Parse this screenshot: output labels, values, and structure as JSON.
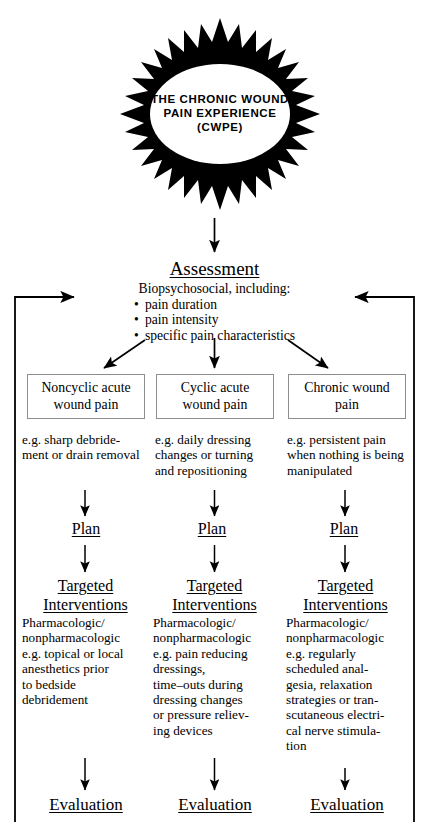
{
  "figure": {
    "background_color": "#ffffff",
    "line_color": "#000000",
    "box_border_color": "#8d8d8d"
  },
  "starburst": {
    "icon": "starburst-shape",
    "line1": "THE CHRONIC WOUND",
    "line2": "PAIN EXPERIENCE",
    "line3": "(CWPE)"
  },
  "assessment": {
    "heading": "Assessment",
    "subheading": "Biopsychosocial, including:",
    "bullets": [
      "pain duration",
      "pain intensity",
      "specific pain characteristics"
    ]
  },
  "columns": [
    {
      "category": "Noncyclic acute\nwound pain",
      "example": "e.g. sharp debride-\nment or drain removal",
      "plan": "Plan",
      "interventions_heading_line1": "Targeted",
      "interventions_heading_line2": "Interventions",
      "intervention_detail": "Pharmacologic/\nnonpharmacologic\ne.g. topical or local\nanesthetics prior\nto bedside\ndebridement",
      "evaluation": "Evaluation"
    },
    {
      "category": "Cyclic acute\nwound pain",
      "example": "e.g. daily dressing\nchanges or turning\nand repositioning",
      "plan": "Plan",
      "interventions_heading_line1": "Targeted",
      "interventions_heading_line2": "Interventions",
      "intervention_detail": "Pharmacologic/\nnonpharmacologic\ne.g. pain reducing\ndressings,\ntime–outs during\ndressing changes\nor pressure reliev-\ning devices",
      "evaluation": "Evaluation"
    },
    {
      "category": "Chronic wound\npain",
      "example": "e.g. persistent pain\nwhen nothing is being\nmanipulated",
      "plan": "Plan",
      "interventions_heading_line1": "Targeted",
      "interventions_heading_line2": "Interventions",
      "intervention_detail": "Pharmacologic/\nnonpharmacologic\ne.g. regularly\nscheduled anal-\ngesia, relaxation\nstrategies or tran-\nscutaneous electri-\ncal nerve stimula-\ntion",
      "evaluation": "Evaluation"
    }
  ]
}
